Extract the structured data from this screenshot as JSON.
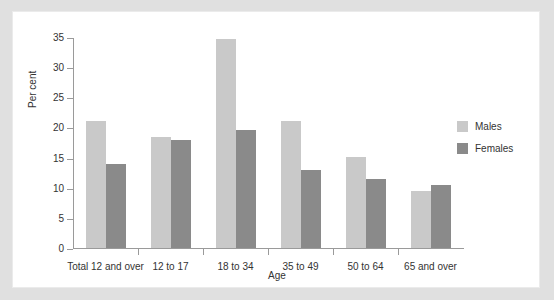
{
  "figure": {
    "background": "#ffffff",
    "page_background": "#e0e0e0"
  },
  "colors": {
    "males": "#c9c9c9",
    "females": "#8a8a8a",
    "axis": "#9a9a9a",
    "text": "#333333"
  },
  "chart_data": {
    "type": "bar",
    "title": "",
    "xlabel": "Age",
    "ylabel": "Per cent",
    "ylim": [
      0,
      35
    ],
    "yticks": [
      0,
      5,
      10,
      15,
      20,
      25,
      30,
      35
    ],
    "ytick_labels": [
      "0",
      "5",
      "10",
      "15",
      "20",
      "25",
      "30",
      "35"
    ],
    "grid": false,
    "legend_position": "right",
    "categories": [
      "Total 12 and over",
      "12 to 17",
      "18 to 34",
      "35 to 49",
      "50 to 64",
      "65 and over"
    ],
    "series": [
      {
        "name": "Males",
        "color": "#c9c9c9",
        "values": [
          21.1,
          18.4,
          34.6,
          21.1,
          15.1,
          9.4
        ]
      },
      {
        "name": "Females",
        "color": "#8a8a8a",
        "values": [
          14.0,
          17.9,
          19.5,
          12.9,
          11.5,
          10.5
        ]
      }
    ]
  },
  "legend": {
    "items": [
      {
        "label": "Males",
        "color": "#c9c9c9"
      },
      {
        "label": "Females",
        "color": "#8a8a8a"
      }
    ]
  }
}
